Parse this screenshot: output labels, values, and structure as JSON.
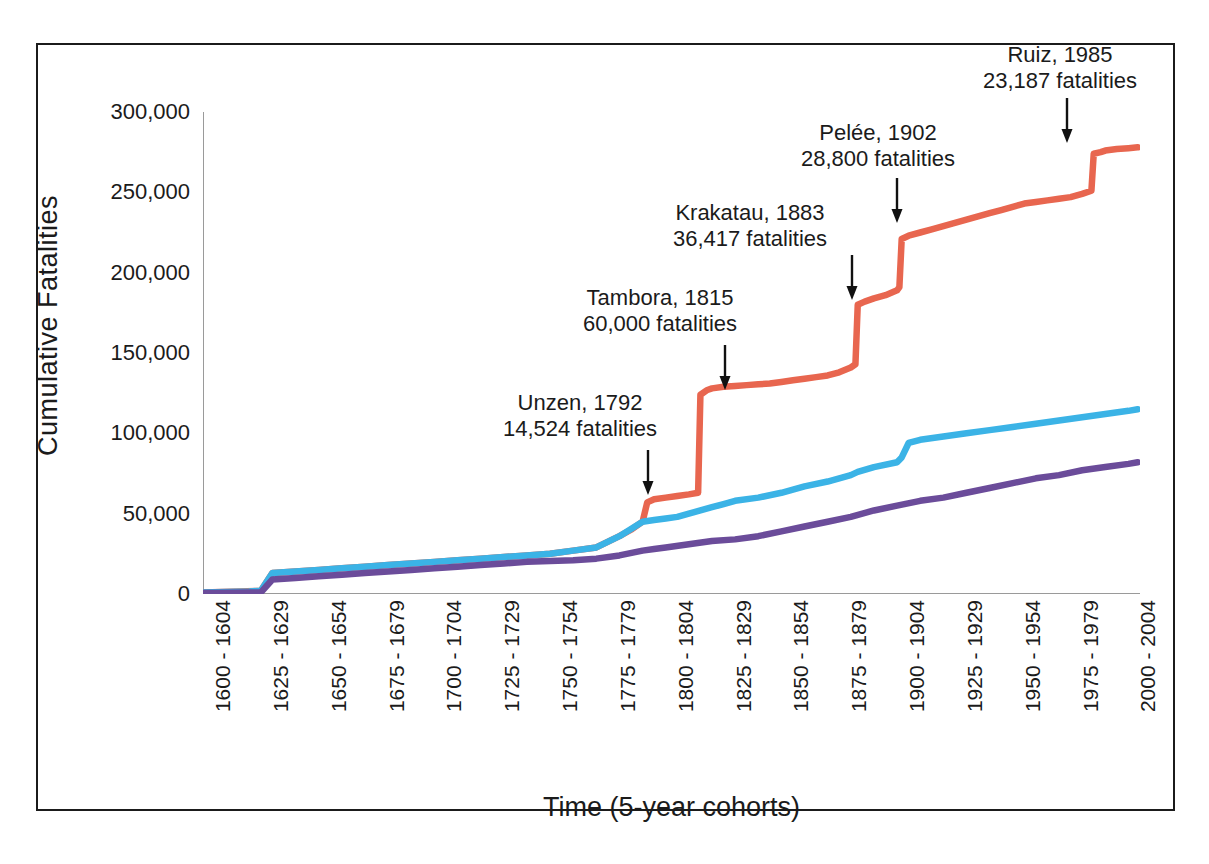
{
  "chart_data": {
    "type": "line",
    "title": "",
    "xlabel": "Time (5-year cohorts)",
    "ylabel": "Cumulative Fatalities",
    "ylim": [
      0,
      300000
    ],
    "yticks": [
      0,
      50000,
      100000,
      150000,
      200000,
      250000,
      300000
    ],
    "ytick_labels": [
      "0",
      "50,000",
      "100,000",
      "150,000",
      "200,000",
      "250,000",
      "300,000"
    ],
    "grid": false,
    "legend": "none",
    "x_major_labels": [
      "1600 - 1604",
      "1625 - 1629",
      "1650 - 1654",
      "1675 - 1679",
      "1700 - 1704",
      "1725 - 1729",
      "1750 - 1754",
      "1775 - 1779",
      "1800 - 1804",
      "1825 - 1829",
      "1850 - 1854",
      "1875 - 1879",
      "1900 - 1904",
      "1925 - 1929",
      "1950 - 1954",
      "1975 - 1979",
      "2000 - 2004"
    ],
    "x_start_year": 1600,
    "x_end_year": 2004,
    "x_cohort_years": 5,
    "series": [
      {
        "name": "total-with-major-events",
        "color": "#E8664F",
        "x": [
          1600,
          1625,
          1630,
          1640,
          1650,
          1660,
          1670,
          1680,
          1690,
          1700,
          1710,
          1720,
          1730,
          1740,
          1750,
          1760,
          1770,
          1780,
          1785,
          1790,
          1792,
          1795,
          1800,
          1805,
          1810,
          1814,
          1815,
          1818,
          1820,
          1825,
          1830,
          1835,
          1840,
          1845,
          1850,
          1855,
          1860,
          1865,
          1870,
          1875,
          1880,
          1882,
          1883,
          1886,
          1890,
          1895,
          1900,
          1901,
          1902,
          1905,
          1910,
          1915,
          1920,
          1925,
          1930,
          1935,
          1940,
          1945,
          1950,
          1955,
          1960,
          1965,
          1970,
          1975,
          1980,
          1984,
          1985,
          1988,
          1990,
          1995,
          2000,
          2004
        ],
        "y": [
          1000,
          2000,
          13000,
          14000,
          15000,
          16000,
          17000,
          18000,
          19000,
          20000,
          21000,
          22000,
          23000,
          24000,
          25000,
          27000,
          29000,
          36000,
          40000,
          45000,
          57000,
          59000,
          60000,
          61000,
          62000,
          63000,
          124000,
          127000,
          128000,
          129000,
          129500,
          130000,
          130500,
          131000,
          132000,
          133000,
          134000,
          135000,
          136000,
          138000,
          141000,
          143000,
          180000,
          182000,
          184000,
          186000,
          189000,
          191000,
          221000,
          223000,
          225000,
          227000,
          229000,
          231000,
          233000,
          235000,
          237000,
          239000,
          241000,
          243000,
          244000,
          245000,
          246000,
          247000,
          249000,
          251000,
          274000,
          275000,
          276000,
          277000,
          277500,
          278000
        ]
      },
      {
        "name": "secondary-cumulative-blue",
        "color": "#3BB3E6",
        "x": [
          1600,
          1620,
          1625,
          1630,
          1640,
          1650,
          1660,
          1670,
          1680,
          1690,
          1700,
          1710,
          1720,
          1730,
          1740,
          1750,
          1760,
          1770,
          1780,
          1790,
          1795,
          1800,
          1805,
          1810,
          1815,
          1820,
          1825,
          1830,
          1840,
          1850,
          1855,
          1860,
          1870,
          1880,
          1883,
          1890,
          1900,
          1902,
          1905,
          1910,
          1920,
          1930,
          1940,
          1950,
          1960,
          1970,
          1980,
          1990,
          2000,
          2004
        ],
        "y": [
          1000,
          1500,
          2000,
          13000,
          14000,
          15000,
          16000,
          17000,
          18000,
          19000,
          20000,
          21000,
          22000,
          23000,
          24000,
          25000,
          27000,
          29000,
          36000,
          45000,
          46000,
          47000,
          48000,
          50000,
          52000,
          54000,
          56000,
          58000,
          60000,
          63000,
          65000,
          67000,
          70000,
          74000,
          76000,
          79000,
          82000,
          85000,
          94000,
          96000,
          98000,
          100000,
          102000,
          104000,
          106000,
          108000,
          110000,
          112000,
          114000,
          115000
        ]
      },
      {
        "name": "tertiary-cumulative-purple",
        "color": "#6B4C9A",
        "x": [
          1600,
          1620,
          1625,
          1630,
          1640,
          1650,
          1660,
          1670,
          1680,
          1690,
          1700,
          1710,
          1720,
          1730,
          1740,
          1750,
          1760,
          1770,
          1780,
          1790,
          1795,
          1800,
          1810,
          1820,
          1830,
          1840,
          1850,
          1860,
          1870,
          1880,
          1890,
          1900,
          1910,
          1920,
          1930,
          1940,
          1950,
          1960,
          1970,
          1980,
          1990,
          2000,
          2004
        ],
        "y": [
          700,
          900,
          1000,
          9000,
          10000,
          11000,
          12000,
          13000,
          14000,
          15000,
          16000,
          17000,
          18000,
          19000,
          20000,
          20500,
          21000,
          22000,
          24000,
          27000,
          28000,
          29000,
          31000,
          33000,
          34000,
          36000,
          39000,
          42000,
          45000,
          48000,
          52000,
          55000,
          58000,
          60000,
          63000,
          66000,
          69000,
          72000,
          74000,
          77000,
          79000,
          81000,
          82000
        ]
      }
    ],
    "annotations": [
      {
        "id": "unzen",
        "line1": "Unzen, 1792",
        "line2": "14,524 fatalities",
        "event_year": 1792,
        "fatalities": 14524
      },
      {
        "id": "tambora",
        "line1": "Tambora, 1815",
        "line2": "60,000 fatalities",
        "event_year": 1815,
        "fatalities": 60000
      },
      {
        "id": "krakatau",
        "line1": "Krakatau, 1883",
        "line2": "36,417 fatalities",
        "event_year": 1883,
        "fatalities": 36417
      },
      {
        "id": "pelee",
        "line1": "Pelée, 1902",
        "line2": "28,800 fatalities",
        "event_year": 1902,
        "fatalities": 28800
      },
      {
        "id": "ruiz",
        "line1": "Ruiz, 1985",
        "line2": "23,187 fatalities",
        "event_year": 1985,
        "fatalities": 23187
      }
    ]
  },
  "colors": {
    "axis": "#9a9a9a",
    "text": "#1b1b1b",
    "frame": "#1b1b1b",
    "background": "#ffffff",
    "series_red": "#E8664F",
    "series_blue": "#3BB3E6",
    "series_purple": "#6B4C9A"
  }
}
